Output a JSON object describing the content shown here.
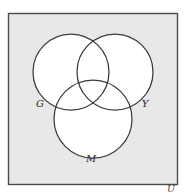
{
  "figure": {
    "type": "venn-diagram",
    "title": "",
    "clipped_caption_above": "",
    "universe": {
      "label": "U",
      "shape": "rectangle",
      "fill_color": "#e8e8e8",
      "stroke_color": "#4a4a4a",
      "x": 8,
      "y": 13,
      "width": 170,
      "height": 172,
      "label_x": 171,
      "label_y": 192
    },
    "circles": [
      {
        "label": "G",
        "name": "green-set",
        "cx": 71,
        "cy": 72,
        "r": 38,
        "fill_color": "#ffffff",
        "stroke_color": "#3a3a3a",
        "label_x": 40,
        "label_y": 107
      },
      {
        "label": "Y",
        "name": "yellow-set",
        "cx": 115,
        "cy": 72,
        "r": 38,
        "fill_color": "#ffffff",
        "stroke_color": "#3a3a3a",
        "label_x": 145,
        "label_y": 107
      },
      {
        "label": "M",
        "name": "magenta-set",
        "cx": 93,
        "cy": 119,
        "r": 39,
        "fill_color": "#ffffff",
        "stroke_color": "#3a3a3a",
        "label_x": 91,
        "label_y": 162
      }
    ],
    "colors": {
      "background": "#ffffff",
      "universe_fill": "#e8e8e8",
      "circle_fill": "#ffffff",
      "stroke": "#3a3a3a",
      "label_text": "#2b2b2b"
    }
  }
}
